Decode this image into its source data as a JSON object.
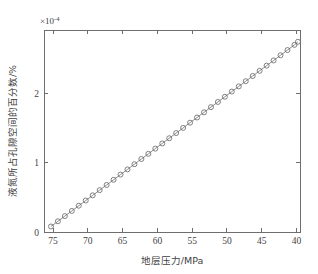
{
  "figure": {
    "background_color": "#ffffff",
    "axes_color": "#6e6e6e",
    "series_color": "#808080",
    "marker_color": "#6b6b6b"
  },
  "labels": {
    "y_exponent": "×10",
    "y_exponent_power": "-4",
    "x_title": "地层压力/MPa",
    "y_title": "液氮所占孔隙空间的百分数/%"
  },
  "chart_data": {
    "type": "line",
    "title": "",
    "xlabel": "地层压力/MPa",
    "ylabel": "液氮所占孔隙空间的百分数/%",
    "y_multiplier": 0.0001,
    "y_multiplier_label": "×10^-4",
    "xlim": [
      76.3,
      39.5
    ],
    "ylim": [
      0,
      2.92
    ],
    "x_reversed": true,
    "grid": false,
    "legend": null,
    "xticks": [
      75,
      70,
      65,
      60,
      55,
      50,
      45,
      40
    ],
    "xticklabels": [
      "75",
      "70",
      "65",
      "60",
      "55",
      "50",
      "45",
      "40"
    ],
    "yticks": [
      0,
      1,
      2
    ],
    "yticklabels": [
      "0",
      "1",
      "2"
    ],
    "marker": "circle",
    "linestyle": "solid",
    "series": [
      {
        "name": "液氮百分数",
        "x": [
          75.3,
          74.3,
          73.3,
          72.3,
          71.3,
          70.3,
          69.3,
          68.3,
          67.3,
          66.3,
          65.3,
          64.3,
          63.3,
          62.3,
          61.3,
          60.3,
          59.3,
          58.3,
          57.3,
          56.3,
          55.3,
          54.3,
          53.3,
          52.3,
          51.3,
          50.3,
          49.3,
          48.3,
          47.3,
          46.3,
          45.3,
          44.3,
          43.3,
          42.3,
          41.3,
          40.3,
          39.8
        ],
        "y": [
          0.08,
          0.155,
          0.23,
          0.305,
          0.38,
          0.455,
          0.53,
          0.605,
          0.68,
          0.755,
          0.83,
          0.905,
          0.98,
          1.055,
          1.13,
          1.205,
          1.28,
          1.355,
          1.43,
          1.505,
          1.58,
          1.655,
          1.73,
          1.805,
          1.88,
          1.955,
          2.03,
          2.105,
          2.18,
          2.255,
          2.33,
          2.405,
          2.48,
          2.555,
          2.63,
          2.705,
          2.75
        ]
      }
    ]
  }
}
